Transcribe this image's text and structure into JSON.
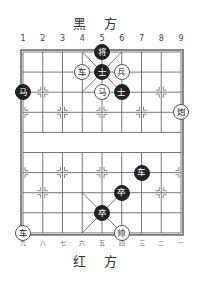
{
  "header": {
    "top_side": "黑 方",
    "bottom_side": "红 方"
  },
  "board": {
    "files": 9,
    "ranks": 10,
    "origin_x": 23,
    "origin_y": 52,
    "file_spacing": 19.75,
    "rank_spacing": 20.1,
    "line_color": "#555555",
    "top_file_labels": [
      "1",
      "2",
      "3",
      "4",
      "5",
      "6",
      "7",
      "8",
      "9"
    ],
    "bottom_file_labels": [
      "九",
      "八",
      "七",
      "六",
      "五",
      "四",
      "三",
      "二",
      "一"
    ]
  },
  "pieces": [
    {
      "side": "black",
      "char": "将",
      "name": "black-general",
      "file": 5,
      "rank": 0
    },
    {
      "side": "red",
      "char": "车",
      "name": "red-chariot",
      "file": 4,
      "rank": 1
    },
    {
      "side": "black",
      "char": "士",
      "name": "black-advisor",
      "file": 5,
      "rank": 1
    },
    {
      "side": "red",
      "char": "兵",
      "name": "red-soldier",
      "file": 6,
      "rank": 1
    },
    {
      "side": "black",
      "char": "马",
      "name": "black-horse",
      "file": 1,
      "rank": 2
    },
    {
      "side": "red",
      "char": "马",
      "name": "red-horse",
      "file": 5,
      "rank": 2
    },
    {
      "side": "black",
      "char": "士",
      "name": "black-advisor",
      "file": 6,
      "rank": 2
    },
    {
      "side": "red",
      "char": "炮",
      "name": "red-cannon",
      "file": 9,
      "rank": 3
    },
    {
      "side": "black",
      "char": "车",
      "name": "black-chariot",
      "file": 7,
      "rank": 6
    },
    {
      "side": "black",
      "char": "卒",
      "name": "black-pawn",
      "file": 6,
      "rank": 7
    },
    {
      "side": "black",
      "char": "卒",
      "name": "black-pawn",
      "file": 5,
      "rank": 8
    },
    {
      "side": "red",
      "char": "车",
      "name": "red-chariot",
      "file": 1,
      "rank": 9
    },
    {
      "side": "red",
      "char": "帅",
      "name": "red-general",
      "file": 6,
      "rank": 9
    }
  ],
  "markers": [
    [
      2,
      2
    ],
    [
      8,
      2
    ],
    [
      1,
      3
    ],
    [
      3,
      3
    ],
    [
      5,
      3
    ],
    [
      7,
      3
    ],
    [
      9,
      3
    ],
    [
      1,
      6
    ],
    [
      3,
      6
    ],
    [
      5,
      6
    ],
    [
      7,
      6
    ],
    [
      9,
      6
    ],
    [
      2,
      7
    ],
    [
      8,
      7
    ]
  ]
}
